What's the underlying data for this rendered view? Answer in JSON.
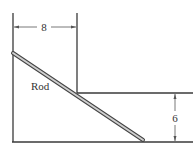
{
  "diagram": {
    "labels": {
      "width_dimension": "8",
      "height_dimension": "6",
      "rod": "Rod"
    },
    "colors": {
      "line": "#3a3a3a",
      "rod_fill": "#cfcfcf",
      "rod_edge": "#444444",
      "background": "#ffffff"
    }
  }
}
